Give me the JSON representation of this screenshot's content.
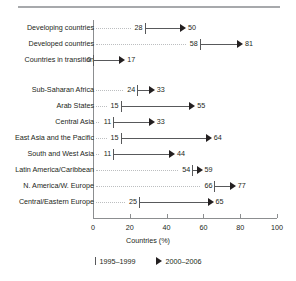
{
  "chart_data": {
    "type": "bar",
    "title": "",
    "subtitle": "",
    "xlabel": "Countries (%)",
    "ylabel": "",
    "xlim": [
      0,
      100
    ],
    "xticks": [
      0,
      20,
      40,
      60,
      80,
      100
    ],
    "xticklabels": [
      "0",
      "20",
      "40",
      "60",
      "80",
      "100"
    ],
    "grid": false,
    "legend_position": "bottom-center",
    "categories": [
      "Developing countries",
      "Developed countries",
      "Countries in transition",
      "Sub-Saharan Africa",
      "Arab States",
      "Central Asia",
      "East Asia and the Pacific",
      "South and West Asia",
      "Latin America/Caribbean",
      "N. America/W. Europe",
      "Central/Eastern Europe"
    ],
    "series": [
      {
        "name": "1995–1999",
        "marker": "tick",
        "values": [
          28,
          58,
          0,
          24,
          15,
          11,
          15,
          11,
          54,
          66,
          25
        ]
      },
      {
        "name": "2000–2006",
        "marker": "arrow",
        "values": [
          50,
          81,
          17,
          33,
          55,
          33,
          64,
          44,
          59,
          77,
          65
        ]
      }
    ],
    "group_break_after_index": 2,
    "colors": {
      "line": "#58595b",
      "arrow": "#231f20",
      "leader": "#bcbec0",
      "axis": "#8c8e90",
      "rule": "#a7a9ac",
      "text": "#231f20"
    }
  },
  "axis": {
    "title": "Countries (%)",
    "ticks": [
      "0",
      "20",
      "40",
      "60",
      "80",
      "100"
    ]
  },
  "legend": {
    "items": [
      {
        "marker": "tick-marker",
        "label": "1995–1999"
      },
      {
        "marker": "arrow-marker",
        "label": "2000–2006"
      }
    ]
  }
}
